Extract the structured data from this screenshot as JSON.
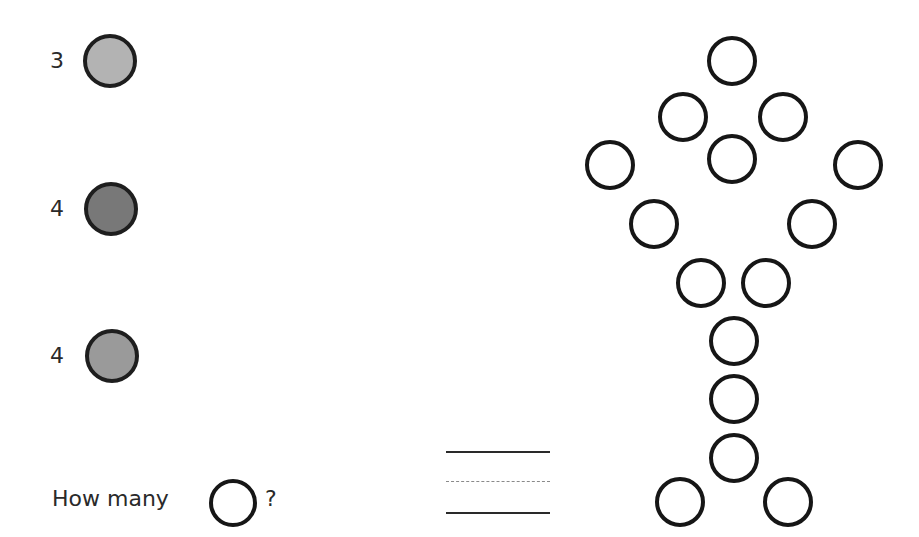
{
  "legend": [
    {
      "label": "3",
      "color": "#b3b3b3",
      "cx": 110,
      "cy": 61,
      "r": 27
    },
    {
      "label": "4",
      "color": "#787878",
      "cx": 111,
      "cy": 209,
      "r": 27
    },
    {
      "label": "4",
      "color": "#9a9a9a",
      "cx": 112,
      "cy": 356,
      "r": 27
    }
  ],
  "question": {
    "prefix": "How many",
    "suffix": "?",
    "icon": "empty-circle-icon"
  },
  "answer_lines": {
    "top": "solid",
    "middle": "dashed",
    "bottom": "solid"
  },
  "figure": {
    "circle_radius": 25,
    "circles": [
      {
        "cx": 732,
        "cy": 61
      },
      {
        "cx": 683,
        "cy": 117
      },
      {
        "cx": 783,
        "cy": 117
      },
      {
        "cx": 732,
        "cy": 159
      },
      {
        "cx": 610,
        "cy": 165
      },
      {
        "cx": 858,
        "cy": 165
      },
      {
        "cx": 654,
        "cy": 224
      },
      {
        "cx": 812,
        "cy": 224
      },
      {
        "cx": 701,
        "cy": 283
      },
      {
        "cx": 766,
        "cy": 283
      },
      {
        "cx": 734,
        "cy": 341
      },
      {
        "cx": 734,
        "cy": 399
      },
      {
        "cx": 734,
        "cy": 458
      },
      {
        "cx": 680,
        "cy": 502
      },
      {
        "cx": 788,
        "cy": 502
      }
    ]
  }
}
